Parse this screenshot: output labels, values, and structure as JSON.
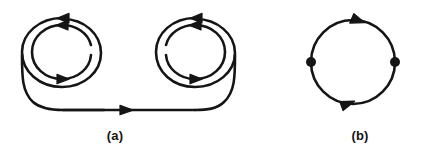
{
  "figure": {
    "background_color": "#ffffff",
    "stroke_color": "#151515",
    "panels": [
      {
        "id": "panel-a",
        "label": "(a)",
        "description": "two double-loop spirals joined by a horizontal line",
        "elements": {
          "left_spiral": {
            "outer_loop_arrow": "arrow-left-top",
            "inner_loop_arrows": [
              "arrow-left-top",
              "arrow-right-bottom"
            ],
            "gap_side": "right"
          },
          "right_spiral": {
            "outer_loop_arrow": "arrow-left-top",
            "inner_loop_arrows": [
              "arrow-left-top",
              "arrow-right-bottom"
            ],
            "gap_side": "left"
          },
          "connector": {
            "type": "horizontal-line",
            "arrow": "arrow-right-center"
          }
        }
      },
      {
        "id": "panel-b",
        "label": "(b)",
        "description": "single circle with two vertex dots and two clockwise arrows",
        "elements": {
          "circle": {
            "arrows": [
              "arrow-right-top",
              "arrow-right-bottom"
            ],
            "direction": "clockwise"
          },
          "vertices": [
            {
              "name": "vertex-left",
              "position": "west"
            },
            {
              "name": "vertex-right",
              "position": "east"
            }
          ]
        }
      }
    ]
  }
}
